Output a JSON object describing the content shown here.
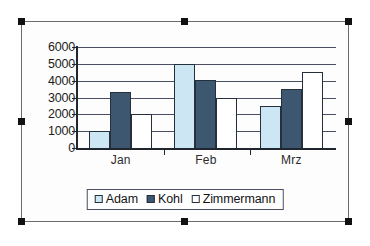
{
  "chart_object": {
    "selected": true,
    "handle_names": [
      "top-left",
      "top-center",
      "top-right",
      "middle-left",
      "middle-right",
      "bottom-left",
      "bottom-center",
      "bottom-right"
    ]
  },
  "chart_data": {
    "type": "bar",
    "title": "",
    "subtitle": "",
    "xlabel": "",
    "ylabel": "",
    "categories": [
      "Jan",
      "Feb",
      "Mrz"
    ],
    "series": [
      {
        "name": "Adam",
        "color": "#cce6f4",
        "values": [
          1000,
          5000,
          2500
        ]
      },
      {
        "name": "Kohl",
        "color": "#3d5771",
        "values": [
          3300,
          4050,
          3500
        ]
      },
      {
        "name": "Zimmermann",
        "color": "#ffffff",
        "values": [
          2000,
          3000,
          4500
        ]
      }
    ],
    "ylim": [
      0,
      6000
    ],
    "y_ticks": [
      0,
      1000,
      2000,
      3000,
      4000,
      5000,
      6000
    ],
    "y_tick_labels": [
      "0",
      "1000",
      "2000",
      "3000",
      "4000",
      "5000",
      "6000"
    ],
    "grid": true,
    "grid_axis": "y",
    "legend_position": "bottom",
    "legend_border": true,
    "bar_outline_color": "#26303c",
    "axis_color": "#21262e",
    "gridline_color": "#4a4f63"
  }
}
